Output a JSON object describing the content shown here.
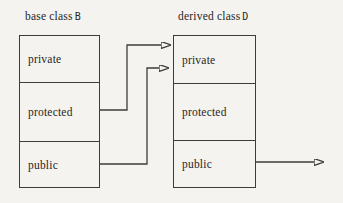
{
  "colors": {
    "background": "#f4f3ef",
    "line": "#3c3c3c",
    "text": "#262626"
  },
  "base_class": {
    "title_prefix": "base class",
    "class_name": "B",
    "sections": [
      {
        "label": "private"
      },
      {
        "label": "protected"
      },
      {
        "label": "public"
      }
    ]
  },
  "derived_class": {
    "title_prefix": "derived class",
    "class_name": "D",
    "sections": [
      {
        "label": "private"
      },
      {
        "label": "protected"
      },
      {
        "label": "public"
      }
    ]
  },
  "arrows": [
    {
      "name": "base-protected-to-derived-private",
      "from": "base class protected section",
      "to": "derived class private section"
    },
    {
      "name": "base-public-to-derived-private",
      "from": "base class public section",
      "to": "derived class private section"
    },
    {
      "name": "derived-public-outward",
      "from": "derived class public section",
      "to": "outside (right edge)"
    }
  ]
}
